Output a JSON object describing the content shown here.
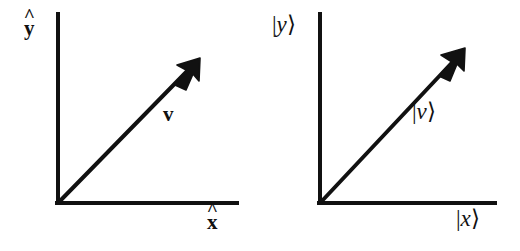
{
  "figure": {
    "background_color": "#ffffff",
    "ink_color": "#111111",
    "width": 520,
    "height": 251
  },
  "diagrams": [
    {
      "id": "classical",
      "notation": "hat-boldface",
      "y_axis_label": {
        "base": "y",
        "accent": "^",
        "style": "bold-hat"
      },
      "x_axis_label": {
        "base": "x",
        "accent": "^",
        "style": "bold-hat"
      },
      "vector_label": {
        "text": "v",
        "style": "bold"
      },
      "origin": {
        "x": 58,
        "y": 203
      },
      "y_axis_top": {
        "x": 58,
        "y": 14
      },
      "x_axis_right": {
        "x": 237,
        "y": 203
      },
      "arrow_tip": {
        "x": 200,
        "y": 58
      }
    },
    {
      "id": "dirac",
      "notation": "ket",
      "y_axis_label": {
        "bar": "|",
        "base": "y",
        "angle": "⟩",
        "style": "ket"
      },
      "x_axis_label": {
        "bar": "|",
        "base": "x",
        "angle": "⟩",
        "style": "ket"
      },
      "vector_label": {
        "bar": "|",
        "base": "v",
        "angle": "⟩",
        "style": "ket"
      },
      "origin": {
        "x": 60,
        "y": 203
      },
      "y_axis_top": {
        "x": 60,
        "y": 14
      },
      "x_axis_right": {
        "x": 235,
        "y": 203
      },
      "arrow_tip": {
        "x": 205,
        "y": 48
      }
    }
  ]
}
